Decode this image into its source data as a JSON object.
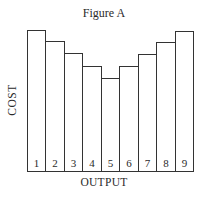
{
  "chart_data": {
    "type": "bar",
    "title": "Figure A",
    "xlabel": "OUTPUT",
    "ylabel": "COST",
    "categories": [
      "1",
      "2",
      "3",
      "4",
      "5",
      "6",
      "7",
      "8",
      "9"
    ],
    "values": [
      142,
      131,
      119,
      106,
      94,
      106,
      118,
      130,
      141
    ],
    "value_units": "relative height (no y-axis scale shown)",
    "ylim": [
      0,
      152
    ],
    "grid": false,
    "legend": null,
    "bar_style": "outlined, no fill, adjacent (no gaps)",
    "colors": {
      "outline": "#333333",
      "fill": "#ffffff"
    }
  }
}
